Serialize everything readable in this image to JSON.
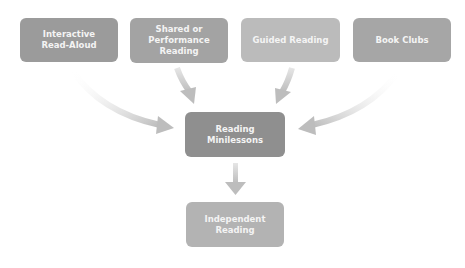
{
  "diagram": {
    "sources": [
      {
        "id": "interactive-read-aloud",
        "lines": [
          "Interactive",
          "Read-Aloud"
        ],
        "color": "#9b9b9b"
      },
      {
        "id": "shared-or-performance-reading",
        "lines": [
          "Shared or",
          "Performance",
          "Reading"
        ],
        "color": "#a3a3a3"
      },
      {
        "id": "guided-reading",
        "lines": [
          "Guided Reading"
        ],
        "color": "#bbbbbb"
      },
      {
        "id": "book-clubs",
        "lines": [
          "Book Clubs"
        ],
        "color": "#a6a6a6"
      }
    ],
    "center": {
      "id": "reading-minilessons",
      "lines": [
        "Reading",
        "Minilessons"
      ],
      "color": "#8f8f8f"
    },
    "target": {
      "id": "independent-reading",
      "lines": [
        "Independent",
        "Reading"
      ],
      "color": "#b3b3b3"
    },
    "edges": [
      {
        "from": "interactive-read-aloud",
        "to": "reading-minilessons"
      },
      {
        "from": "shared-or-performance-reading",
        "to": "reading-minilessons"
      },
      {
        "from": "guided-reading",
        "to": "reading-minilessons"
      },
      {
        "from": "book-clubs",
        "to": "reading-minilessons"
      },
      {
        "from": "reading-minilessons",
        "to": "independent-reading"
      }
    ],
    "arrow_color": "#bdbdbd"
  }
}
